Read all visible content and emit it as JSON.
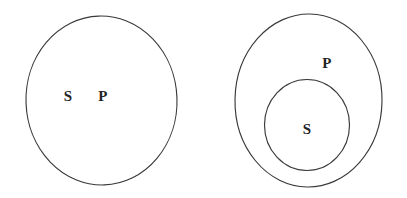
{
  "figure": {
    "background_color": "#ffffff",
    "stroke_color": "#3a3a3a",
    "label_color": "#242424",
    "width": 407,
    "height": 198
  },
  "chart_data": {
    "type": "diagram",
    "diagram_kind": "euler-venn",
    "title": "",
    "panels": [
      {
        "id": "panel-left",
        "name": "coextensive-sets",
        "relation": "S and P coincide (single region)",
        "shapes": [
          {
            "id": "left-circle",
            "kind": "ellipse",
            "cx": 101.5,
            "cy": 100.5,
            "rx": 75.5,
            "ry": 84.5,
            "rotation": -2
          }
        ],
        "labels": [
          {
            "id": "left-label-s",
            "text": "S",
            "x": 68,
            "y": 98
          },
          {
            "id": "left-label-p",
            "text": "P",
            "x": 103,
            "y": 98
          }
        ]
      },
      {
        "id": "panel-right",
        "name": "subset-relation",
        "relation": "S contained within P",
        "shapes": [
          {
            "id": "right-outer-circle",
            "kind": "ellipse",
            "cx": 308.5,
            "cy": 100.5,
            "rx": 73.5,
            "ry": 86.5,
            "rotation": 1
          },
          {
            "id": "right-inner-circle",
            "kind": "ellipse",
            "cx": 307,
            "cy": 125,
            "rx": 42.5,
            "ry": 45.5,
            "rotation": 0
          }
        ],
        "labels": [
          {
            "id": "right-label-p",
            "text": "P",
            "x": 327,
            "y": 65
          },
          {
            "id": "right-label-s",
            "text": "S",
            "x": 307,
            "y": 131
          }
        ]
      }
    ],
    "legend": [],
    "annotations": []
  }
}
